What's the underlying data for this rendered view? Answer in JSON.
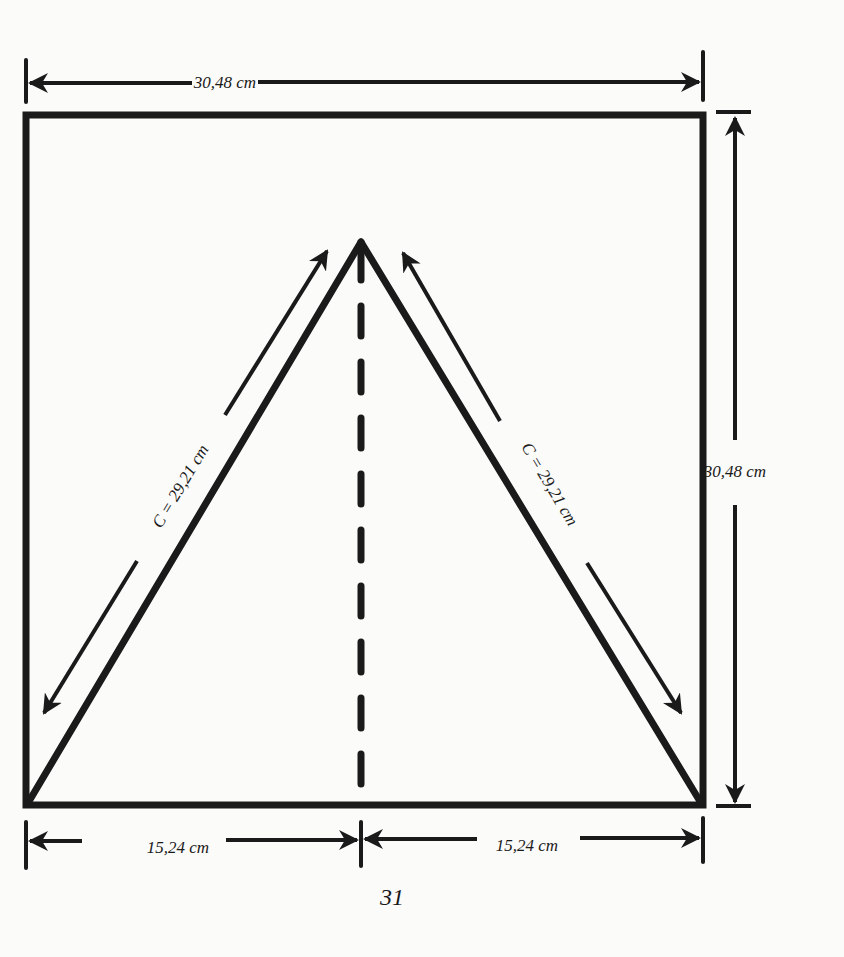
{
  "figure": {
    "colors": {
      "ink": "#1a1a1a",
      "paper": "#fbfbf9"
    },
    "dimensions": {
      "top_width": "30,48 cm",
      "right_height": "30,48 cm",
      "left_side": "C = 29,21 cm",
      "right_side": "C = 29,21 cm",
      "bottom_left_half": "15,24 cm",
      "bottom_right_half": "15,24 cm"
    },
    "center_line": "dashed"
  },
  "page": {
    "number": "31"
  }
}
